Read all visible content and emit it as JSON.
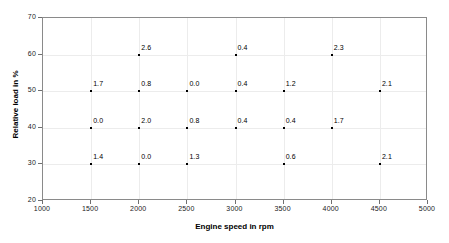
{
  "chart_data": {
    "type": "scatter",
    "title": "",
    "xlabel": "Engine speed in rpm",
    "ylabel": "Relative load in %",
    "xlim": [
      1000,
      5000
    ],
    "ylim": [
      20,
      70
    ],
    "xticks": [
      1000,
      1500,
      2000,
      2500,
      3000,
      3500,
      4000,
      4500,
      5000
    ],
    "yticks": [
      20,
      30,
      40,
      50,
      60,
      70
    ],
    "grid": true,
    "legend": null,
    "point_labels": true,
    "points": [
      {
        "x": 2000,
        "y": 60,
        "label": "2.6"
      },
      {
        "x": 3000,
        "y": 60,
        "label": "0.4"
      },
      {
        "x": 4000,
        "y": 60,
        "label": "2.3"
      },
      {
        "x": 1500,
        "y": 50,
        "label": "1.7"
      },
      {
        "x": 2000,
        "y": 50,
        "label": "0.8"
      },
      {
        "x": 2500,
        "y": 50,
        "label": "0.0"
      },
      {
        "x": 3000,
        "y": 50,
        "label": "0.4"
      },
      {
        "x": 3500,
        "y": 50,
        "label": "1.2"
      },
      {
        "x": 4500,
        "y": 50,
        "label": "2.1"
      },
      {
        "x": 1500,
        "y": 40,
        "label": "0.0"
      },
      {
        "x": 2000,
        "y": 40,
        "label": "2.0"
      },
      {
        "x": 2500,
        "y": 40,
        "label": "0.8"
      },
      {
        "x": 3000,
        "y": 40,
        "label": "0.4"
      },
      {
        "x": 3500,
        "y": 40,
        "label": "0.4"
      },
      {
        "x": 4000,
        "y": 40,
        "label": "1.7"
      },
      {
        "x": 1500,
        "y": 30,
        "label": "1.4"
      },
      {
        "x": 2000,
        "y": 30,
        "label": "0.0"
      },
      {
        "x": 2500,
        "y": 30,
        "label": "1.3"
      },
      {
        "x": 3500,
        "y": 30,
        "label": "0.6"
      },
      {
        "x": 4500,
        "y": 30,
        "label": "2.1"
      }
    ]
  },
  "colors": {
    "point": "#000000",
    "frame": "#8a8a8a",
    "grid": "#ececec",
    "text": "#1a1a1a"
  }
}
